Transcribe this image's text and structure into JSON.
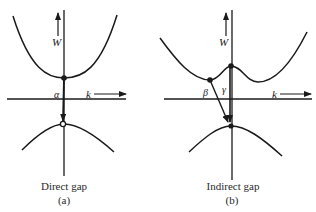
{
  "figure": {
    "colors": {
      "ink": "#1a1a1a",
      "background": "#ffffff"
    },
    "panels": [
      {
        "id": "a",
        "caption": "Direct gap",
        "sublabel": "(a)",
        "axis_labels": {
          "energy": "W",
          "momentum": "k"
        },
        "transitions": [
          {
            "label": "α",
            "type": "direct"
          }
        ]
      },
      {
        "id": "b",
        "caption": "Indirect gap",
        "sublabel": "(b)",
        "axis_labels": {
          "energy": "W",
          "momentum": "k"
        },
        "transitions": [
          {
            "label": "β",
            "type": "indirect"
          },
          {
            "label": "γ",
            "type": "direct"
          }
        ]
      }
    ]
  }
}
